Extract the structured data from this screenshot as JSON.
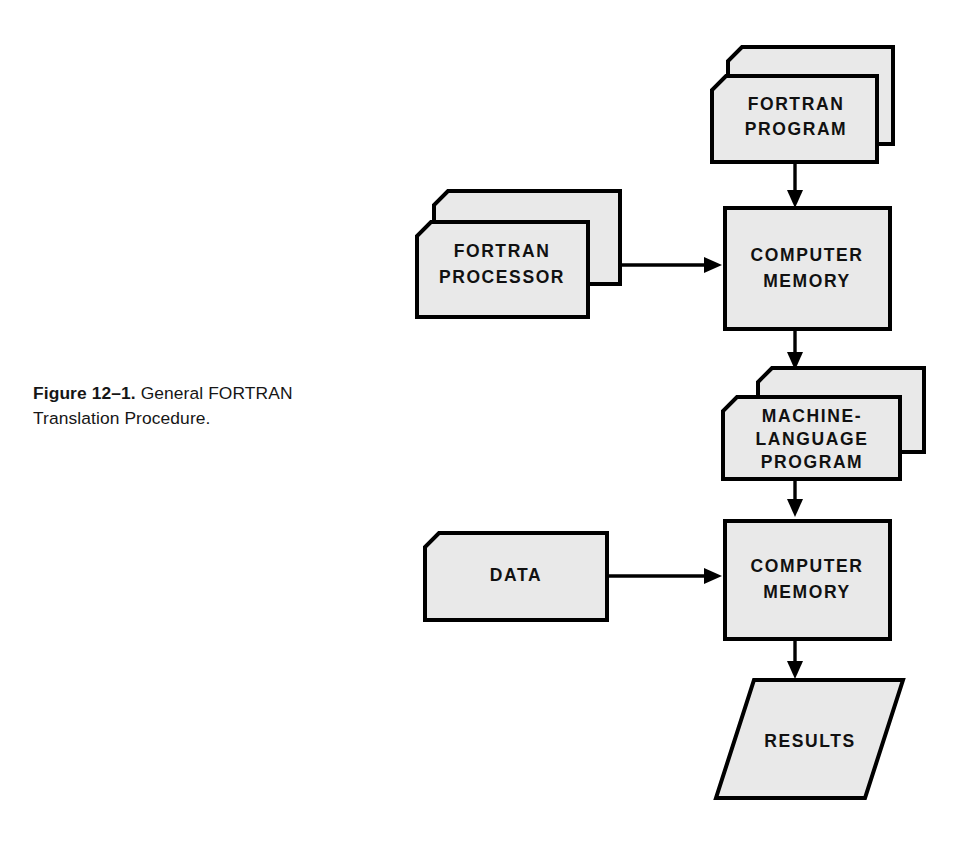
{
  "figure": {
    "caption_label": "Figure 12–1.",
    "caption_text": "General FORTRAN Translation Procedure.",
    "background_color": "#ffffff",
    "shape_fill_color": "#e9e9e9",
    "shape_stroke_color": "#000000",
    "text_color": "#111111"
  },
  "nodes": {
    "fortran_program": {
      "label_line1": "FORTRAN",
      "label_line2": "PROGRAM",
      "shape": "card-stack",
      "stack_count": 2
    },
    "fortran_processor": {
      "label_line1": "FORTRAN",
      "label_line2": "PROCESSOR",
      "shape": "card-stack",
      "stack_count": 2
    },
    "computer_memory_1": {
      "label_line1": "COMPUTER",
      "label_line2": "MEMORY",
      "shape": "rectangle"
    },
    "machine_language_program": {
      "label_line1": "MACHINE-",
      "label_line2": "LANGUAGE",
      "label_line3": "PROGRAM",
      "shape": "card-stack",
      "stack_count": 2
    },
    "data": {
      "label_line1": "DATA",
      "shape": "card"
    },
    "computer_memory_2": {
      "label_line1": "COMPUTER",
      "label_line2": "MEMORY",
      "shape": "rectangle"
    },
    "results": {
      "label_line1": "RESULTS",
      "shape": "parallelogram"
    }
  },
  "connectors": [
    {
      "name": "fortran-program-to-memory-1",
      "direction": "down"
    },
    {
      "name": "fortran-processor-to-memory-1",
      "direction": "right"
    },
    {
      "name": "memory-1-to-machine-language",
      "direction": "down"
    },
    {
      "name": "machine-language-to-memory-2",
      "direction": "down"
    },
    {
      "name": "data-to-memory-2",
      "direction": "right"
    },
    {
      "name": "memory-2-to-results",
      "direction": "down"
    }
  ]
}
